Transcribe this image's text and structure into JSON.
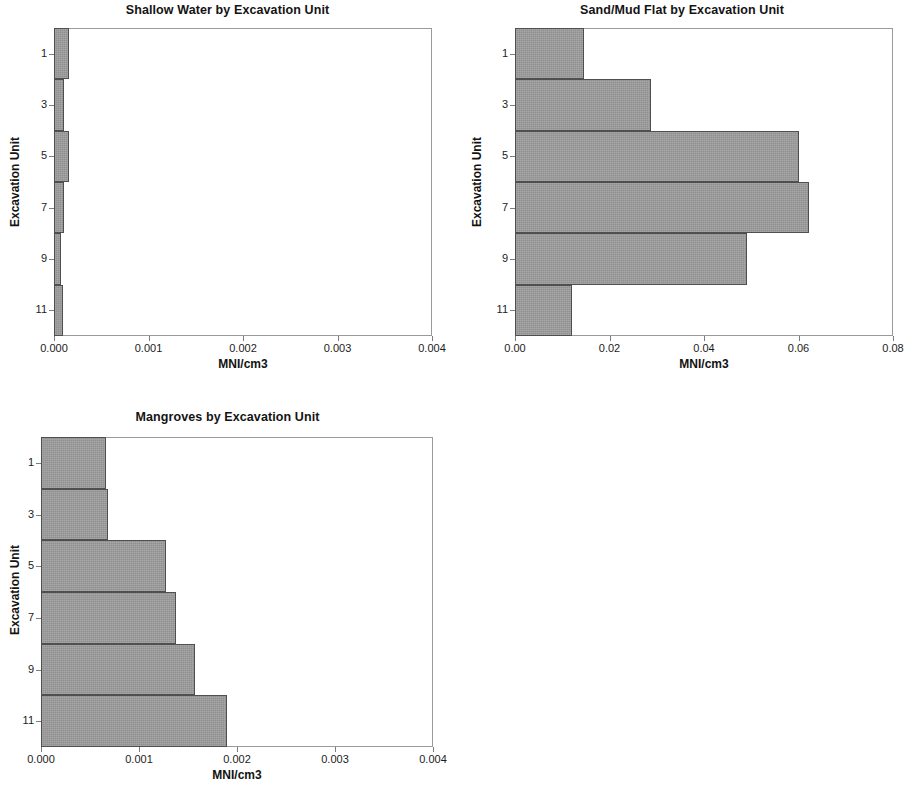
{
  "figure": {
    "background": "#ffffff",
    "bar_fill": "#9c9c9c",
    "bar_edge": "#4f4f4f",
    "frame_color": "#9a9a9a"
  },
  "chart_data": [
    {
      "type": "bar",
      "orientation": "horizontal",
      "title": "Shallow Water by Excavation Unit",
      "xlabel": "MNI/cm3",
      "ylabel": "Excavation Unit",
      "categories": [
        "1",
        "3",
        "5",
        "7",
        "9",
        "11"
      ],
      "values": [
        0.00016,
        0.00011,
        0.00016,
        0.00011,
        7e-05,
        9e-05
      ],
      "xlim": [
        0.0,
        0.004
      ],
      "xticks": [
        0.0,
        0.001,
        0.002,
        0.003,
        0.004
      ],
      "xticklabels": [
        "0.000",
        "0.001",
        "0.002",
        "0.003",
        "0.004"
      ],
      "yticklabels": [
        "1",
        "3",
        "5",
        "7",
        "9",
        "11"
      ],
      "grid": false,
      "legend": false
    },
    {
      "type": "bar",
      "orientation": "horizontal",
      "title": "Sand/Mud Flat by Excavation Unit",
      "xlabel": "MNI/cm3",
      "ylabel": "Excavation Unit",
      "categories": [
        "1",
        "3",
        "5",
        "7",
        "9",
        "11"
      ],
      "values": [
        0.0146,
        0.0288,
        0.0602,
        0.0622,
        0.049,
        0.012
      ],
      "xlim": [
        0.0,
        0.08
      ],
      "xticks": [
        0.0,
        0.02,
        0.04,
        0.06,
        0.08
      ],
      "xticklabels": [
        "0.00",
        "0.02",
        "0.04",
        "0.06",
        "0.08"
      ],
      "yticklabels": [
        "1",
        "3",
        "5",
        "7",
        "9",
        "11"
      ],
      "grid": false,
      "legend": false
    },
    {
      "type": "bar",
      "orientation": "horizontal",
      "title": "Mangroves by Excavation Unit",
      "xlabel": "MNI/cm3",
      "ylabel": "Excavation Unit",
      "categories": [
        "1",
        "3",
        "5",
        "7",
        "9",
        "11"
      ],
      "values": [
        0.00066,
        0.00068,
        0.00128,
        0.00138,
        0.00157,
        0.0019
      ],
      "xlim": [
        0.0,
        0.004
      ],
      "xticks": [
        0.0,
        0.001,
        0.002,
        0.003,
        0.004
      ],
      "xticklabels": [
        "0.000",
        "0.001",
        "0.002",
        "0.003",
        "0.004"
      ],
      "yticklabels": [
        "1",
        "3",
        "5",
        "7",
        "9",
        "11"
      ],
      "grid": false,
      "legend": false
    }
  ]
}
